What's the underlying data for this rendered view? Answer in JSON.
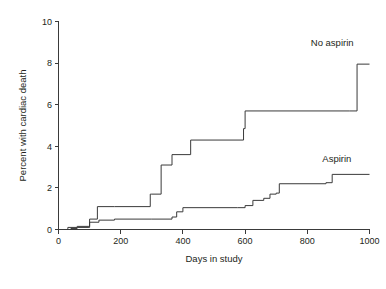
{
  "chart_data": {
    "type": "line",
    "subtype": "step-post",
    "title": "",
    "xlabel": "Days in study",
    "ylabel": "Percent with cardiac death",
    "xlim": [
      0,
      1000
    ],
    "ylim": [
      0,
      10
    ],
    "xticks": [
      0,
      200,
      400,
      600,
      800,
      1000
    ],
    "xtick_labels": [
      "0",
      "200",
      "400",
      "600",
      "800",
      "1000"
    ],
    "yticks": [
      0,
      2,
      4,
      6,
      8,
      10
    ],
    "ytick_labels": [
      "0",
      "2",
      "4",
      "6",
      "8",
      "10"
    ],
    "grid": false,
    "legend_position": "inline-right-of-curve",
    "series": [
      {
        "name": "No aspirin",
        "label": "No aspirin",
        "color": "#3a3a3a",
        "label_x": 880,
        "label_y": 8.8,
        "x": [
          0,
          30,
          60,
          95,
          100,
          125,
          180,
          295,
          300,
          330,
          365,
          425,
          595,
          600,
          935,
          960,
          1000
        ],
        "y": [
          0,
          0.1,
          0.15,
          0.15,
          0.5,
          1.1,
          1.1,
          1.7,
          1.7,
          3.1,
          3.6,
          4.3,
          4.85,
          5.7,
          5.7,
          7.95,
          7.95
        ]
      },
      {
        "name": "Aspirin",
        "label": "Aspirin",
        "color": "#3a3a3a",
        "label_x": 895,
        "label_y": 3.25,
        "x": [
          0,
          40,
          60,
          95,
          100,
          130,
          180,
          300,
          365,
          380,
          400,
          575,
          600,
          625,
          660,
          680,
          700,
          710,
          860,
          880,
          1000
        ],
        "y": [
          0,
          0.05,
          0.1,
          0.1,
          0.35,
          0.45,
          0.5,
          0.5,
          0.6,
          0.85,
          1.05,
          1.05,
          1.15,
          1.4,
          1.5,
          1.7,
          1.75,
          2.2,
          2.25,
          2.65,
          2.65
        ]
      }
    ]
  },
  "axes": {
    "y_axis_title": "Percent with cardiac death",
    "x_axis_title": "Days in study"
  }
}
